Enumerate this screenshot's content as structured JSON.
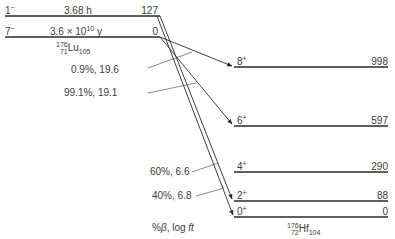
{
  "parent": {
    "nucleus": {
      "A": "176",
      "Z": "71",
      "symbol": "Lu",
      "N": "105"
    },
    "levels": [
      {
        "spin": "1",
        "parity": "−",
        "halflife": "3.68 h",
        "energy": "127"
      },
      {
        "spin": "7",
        "parity": "−",
        "halflife_mantissa": "3.6 × 10",
        "halflife_exp": "10",
        "halflife_unit": " y",
        "energy": "0"
      }
    ]
  },
  "daughter": {
    "nucleus": {
      "A": "176",
      "Z": "72",
      "symbol": "Hf",
      "N": "104"
    },
    "levels": [
      {
        "spin": "8",
        "parity": "+",
        "energy": "998"
      },
      {
        "spin": "6",
        "parity": "+",
        "energy": "597"
      },
      {
        "spin": "4",
        "parity": "+",
        "energy": "290"
      },
      {
        "spin": "2",
        "parity": "+",
        "energy": "88"
      },
      {
        "spin": "0",
        "parity": "+",
        "energy": "0"
      }
    ]
  },
  "branches": [
    {
      "from": "7−",
      "to": "8+",
      "label": "0.9%, 19.6"
    },
    {
      "from": "7−",
      "to": "6+",
      "label": "99.1%, 19.1"
    },
    {
      "from": "1−",
      "to": "2+",
      "label": "60%, 6.6"
    },
    {
      "from": "1−",
      "to": "0+",
      "label": "40%, 6.8"
    }
  ],
  "axis_caption_pre": "%",
  "axis_caption_beta": "β",
  "axis_caption_post": ", log ",
  "axis_caption_ft": "ft",
  "colors": {
    "line": "#2a2a2a",
    "text": "#3c3c3c"
  }
}
